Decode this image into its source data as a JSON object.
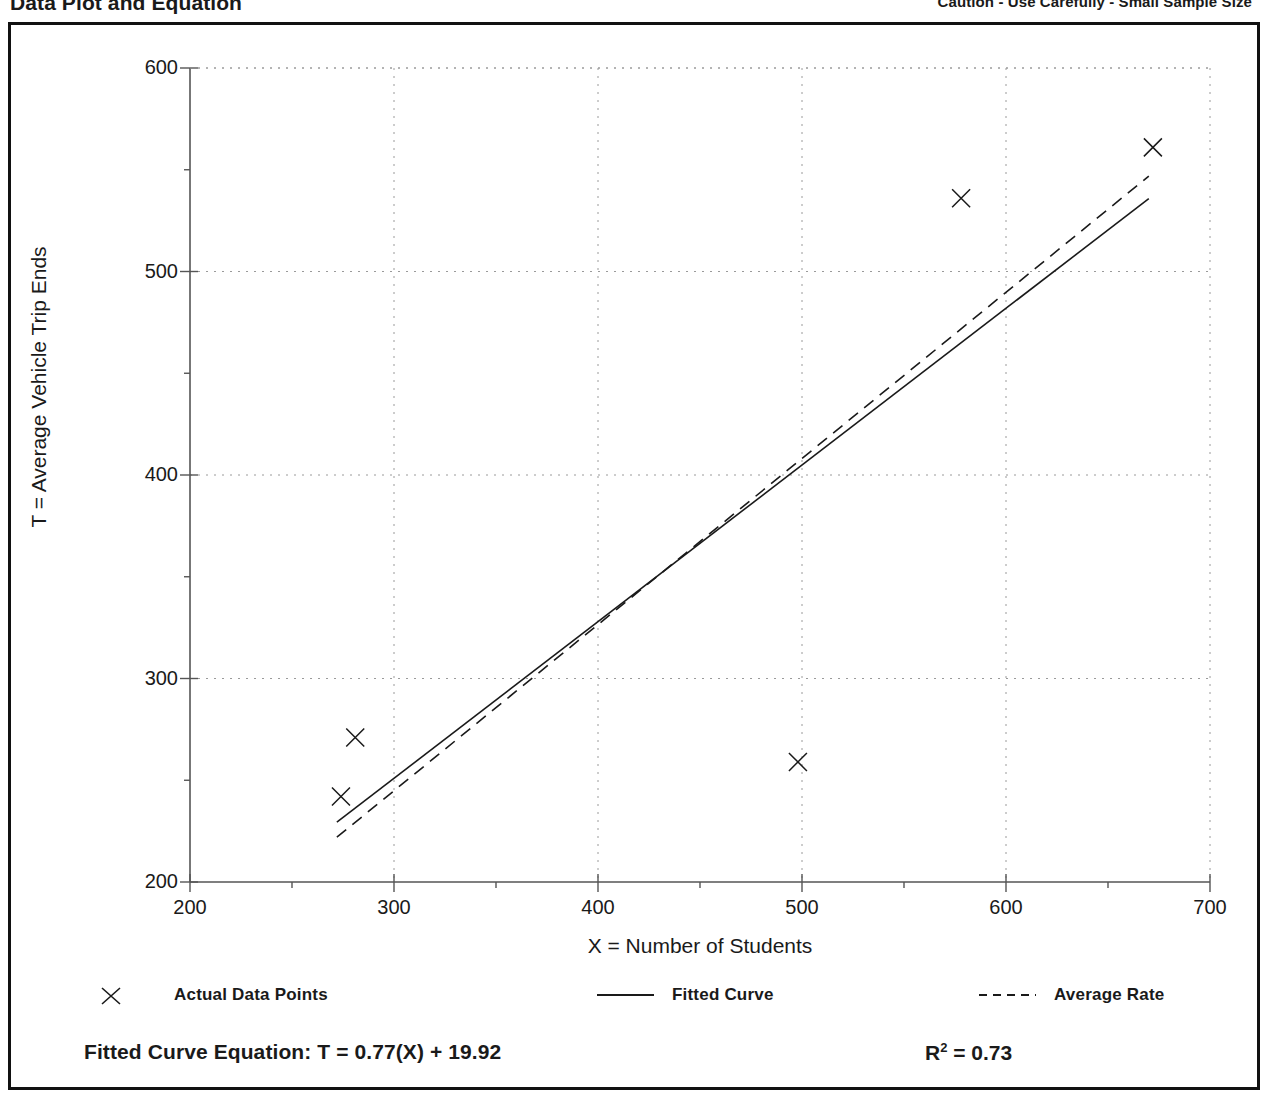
{
  "header": {
    "title": "Data Plot and Equation",
    "caution": "Caution - Use Carefully - Small Sample Size"
  },
  "chart_data": {
    "type": "scatter",
    "title": "Data Plot and Equation",
    "xlabel": "X = Number of Students",
    "ylabel": "T = Average Vehicle Trip Ends",
    "xlim": [
      200,
      700
    ],
    "ylim": [
      200,
      600
    ],
    "xticks": [
      200,
      300,
      400,
      500,
      600,
      700
    ],
    "yticks": [
      200,
      300,
      400,
      500,
      600
    ],
    "xminor_step": 50,
    "yminor_step": 50,
    "grid": "dotted-major",
    "legend_position": "below-axes",
    "series": [
      {
        "name": "Actual Data Points",
        "type": "scatter",
        "marker": "x",
        "points": [
          {
            "x": 274,
            "y": 242
          },
          {
            "x": 281,
            "y": 271
          },
          {
            "x": 498,
            "y": 259
          },
          {
            "x": 578,
            "y": 536
          },
          {
            "x": 672,
            "y": 561
          }
        ]
      },
      {
        "name": "Fitted Curve",
        "type": "line",
        "style": "solid",
        "equation": "T = 0.77(X) + 19.92",
        "slope": 0.77,
        "intercept": 19.92,
        "endpoints": [
          {
            "x": 272,
            "y": 229.4
          },
          {
            "x": 670,
            "y": 535.8
          }
        ]
      },
      {
        "name": "Average Rate",
        "type": "line",
        "style": "dashed",
        "endpoints": [
          {
            "x": 272,
            "y": 222.0
          },
          {
            "x": 670,
            "y": 546.9
          }
        ]
      }
    ]
  },
  "axes": {
    "y_ticks": [
      "600",
      "500",
      "400",
      "300",
      "200"
    ],
    "x_ticks": [
      "200",
      "300",
      "400",
      "500",
      "600",
      "700"
    ],
    "y_title": "T = Average Vehicle Trip Ends",
    "x_title": "X = Number of Students"
  },
  "legend": {
    "items": [
      {
        "label": "Actual Data Points",
        "marker": "x-marker"
      },
      {
        "label": "Fitted Curve",
        "marker": "solid-line"
      },
      {
        "label": "Average Rate",
        "marker": "dashed-line"
      }
    ]
  },
  "footer": {
    "equation_label": "Fitted Curve Equation:  T = 0.77(X) + 19.92",
    "r2_prefix": "R",
    "r2_exp": "2",
    "r2_value": " = 0.73"
  },
  "colors": {
    "ink": "#1a1a1a",
    "grid": "#8c8c8c",
    "axis": "#555555",
    "frame": "#111111"
  }
}
